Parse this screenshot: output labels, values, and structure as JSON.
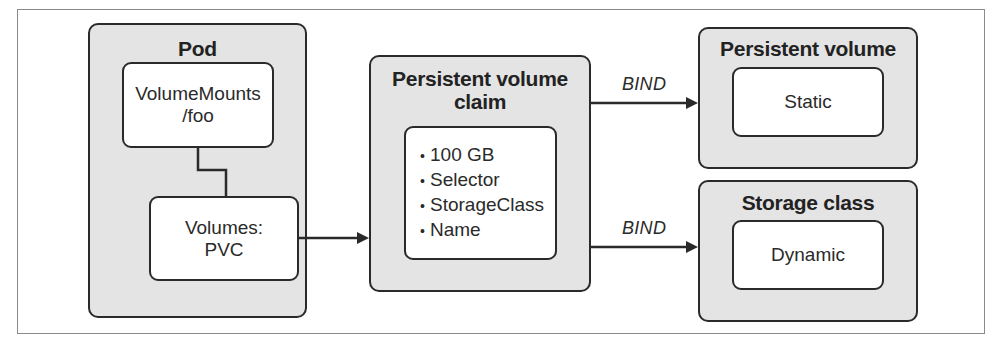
{
  "diagram": {
    "pod": {
      "title": "Pod",
      "volume_mounts": {
        "line1": "VolumeMounts",
        "line2": "/foo"
      },
      "volumes": {
        "line1": "Volumes:",
        "line2": "PVC"
      }
    },
    "pvc": {
      "title_line1": "Persistent volume",
      "title_line2": "claim",
      "items": [
        "100 GB",
        "Selector",
        "StorageClass",
        "Name"
      ],
      "bullet": "•"
    },
    "persistent_volume": {
      "title": "Persistent volume",
      "inner": "Static"
    },
    "storage_class": {
      "title": "Storage class",
      "inner": "Dynamic"
    },
    "edges": [
      {
        "from": "pod.volumes",
        "to": "pvc",
        "label": ""
      },
      {
        "from": "pvc",
        "to": "persistent_volume",
        "label": "BIND"
      },
      {
        "from": "pvc",
        "to": "storage_class",
        "label": "BIND"
      },
      {
        "from": "pod.volume_mounts",
        "to": "pod.volumes",
        "label": ""
      }
    ],
    "colors": {
      "group_fill": "#e4e4e4",
      "inner_fill": "#ffffff",
      "stroke": "#2a2a2a",
      "frame": "#8a8a8a"
    }
  }
}
